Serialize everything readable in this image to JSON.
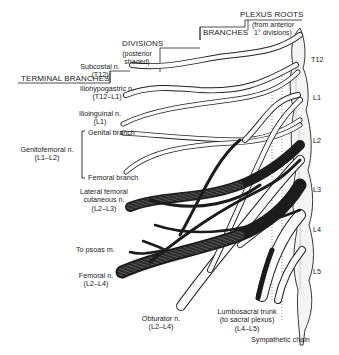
{
  "diagram": {
    "headers": {
      "terminal_branches": "TERMINAL BRANCHES",
      "divisions": "DIVISIONS",
      "divisions_note_1": "(posterior",
      "divisions_note_2": "shaded)",
      "branches": "BRANCHES",
      "plexus_roots": "PLEXUS ROOTS",
      "plexus_roots_note_1": "(from anterior",
      "plexus_roots_note_2": "1° divisions)"
    },
    "levels": [
      "T12",
      "L1",
      "L2",
      "L3",
      "L4",
      "L5"
    ],
    "nerves": [
      {
        "name": "Subcostal n.",
        "roots": "(T12)"
      },
      {
        "name": "Iliohypogastric n.",
        "roots": "(T12–L1)"
      },
      {
        "name": "Ilioinguinal n.",
        "roots": "(L1)"
      },
      {
        "name": "Genitofemoral n.",
        "roots": "(L1–L2)",
        "branches": [
          "Genital branch",
          "Femoral branch"
        ]
      },
      {
        "name": "Lateral femoral",
        "name2": "cutaneous n.",
        "roots": "(L2–L3)"
      },
      {
        "name": "To psoas m."
      },
      {
        "name": "Femoral n.",
        "roots": "(L2–L4)"
      },
      {
        "name": "Obturator n.",
        "roots": "(L2–L4)"
      },
      {
        "name": "Lumbosacral trunk",
        "name2": "(to sacral plexus)",
        "roots": "(L4–L5)"
      }
    ],
    "sympathetic_chain": "Sympathetic chain"
  }
}
